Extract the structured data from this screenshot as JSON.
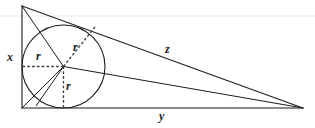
{
  "figure": {
    "stroke_color": "#1b1b1b",
    "dash_color": "#3a3a3a",
    "scanline_color": "#e8e8e8",
    "background": "#ffffff"
  },
  "labels": {
    "vertical_leg": "x",
    "horizontal_leg": "y",
    "hypotenuse": "z",
    "radius_left": "r",
    "radius_upper": "r",
    "radius_lower": "r"
  },
  "geometry": {
    "triangle": {
      "apex_top": [
        22,
        6
      ],
      "corner_bottom_left": [
        22,
        108
      ],
      "corner_bottom_right": [
        303,
        108
      ]
    },
    "incircle": {
      "center": [
        63.5,
        66.5
      ],
      "radius": 41.5
    },
    "tangent_points": {
      "left_side": [
        22,
        66.5
      ],
      "bottom_side": [
        63.5,
        108
      ],
      "hypotenuse": [
        95,
        27
      ]
    }
  }
}
